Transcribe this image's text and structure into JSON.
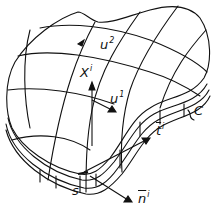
{
  "figure": {
    "colors": {
      "stroke": "#111111",
      "background": "#ffffff"
    },
    "labels": {
      "u2": {
        "base": "u",
        "sup": "2"
      },
      "xi": {
        "base": "X",
        "sup": "i"
      },
      "u1": {
        "base": "u",
        "sup": "1"
      },
      "c": {
        "base": "C"
      },
      "ti": {
        "base": "t",
        "sup": "i"
      },
      "s": {
        "base": "s"
      },
      "ni": {
        "base": "n",
        "sup": "i"
      }
    }
  }
}
